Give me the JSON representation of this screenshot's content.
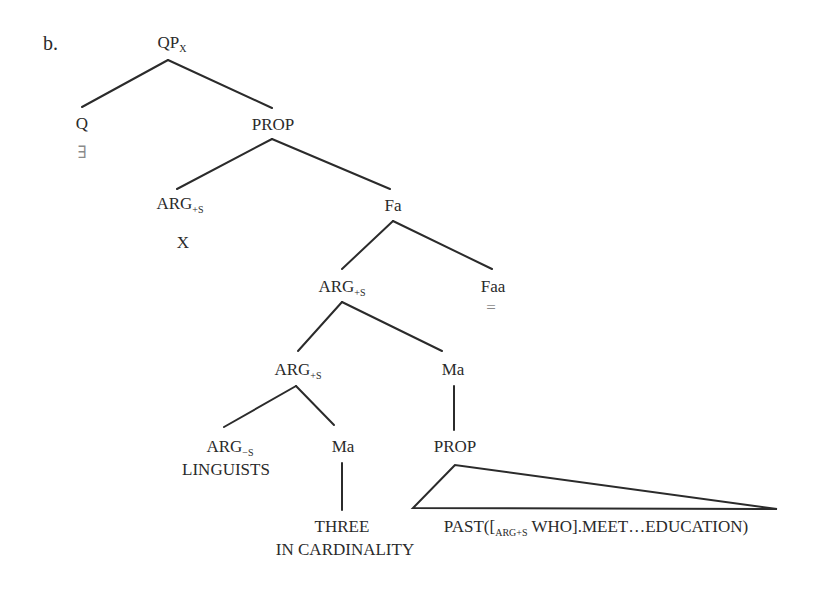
{
  "figure": {
    "label": "b."
  },
  "tree": {
    "root": {
      "text": "QP",
      "sub": "X"
    },
    "q": {
      "text": "Q",
      "value": "∃"
    },
    "prop1": {
      "text": "PROP"
    },
    "arg_s1": {
      "text": "ARG",
      "sub": "+S",
      "value": "X"
    },
    "fa": {
      "text": "Fa"
    },
    "arg_s2": {
      "text": "ARG",
      "sub": "+S"
    },
    "faa": {
      "text": "Faa",
      "value": "="
    },
    "arg_s3": {
      "text": "ARG",
      "sub": "+S"
    },
    "ma1": {
      "text": "Ma"
    },
    "arg_minus_s": {
      "text": "ARG",
      "sub": "−S",
      "value": "LINGUISTS"
    },
    "ma2": {
      "text": "Ma",
      "value_line1": "THREE",
      "value_line2": "IN CARDINALITY"
    },
    "prop2": {
      "text": "PROP",
      "value_prefix": "PAST([",
      "value_sub": "ARG+S",
      "value_suffix": " WHO].MEET…EDUCATION)"
    }
  },
  "colors": {
    "line": "#2b2b2b",
    "text": "#2a2a2a",
    "faint": "#8a8a8a",
    "background": "#ffffff"
  }
}
